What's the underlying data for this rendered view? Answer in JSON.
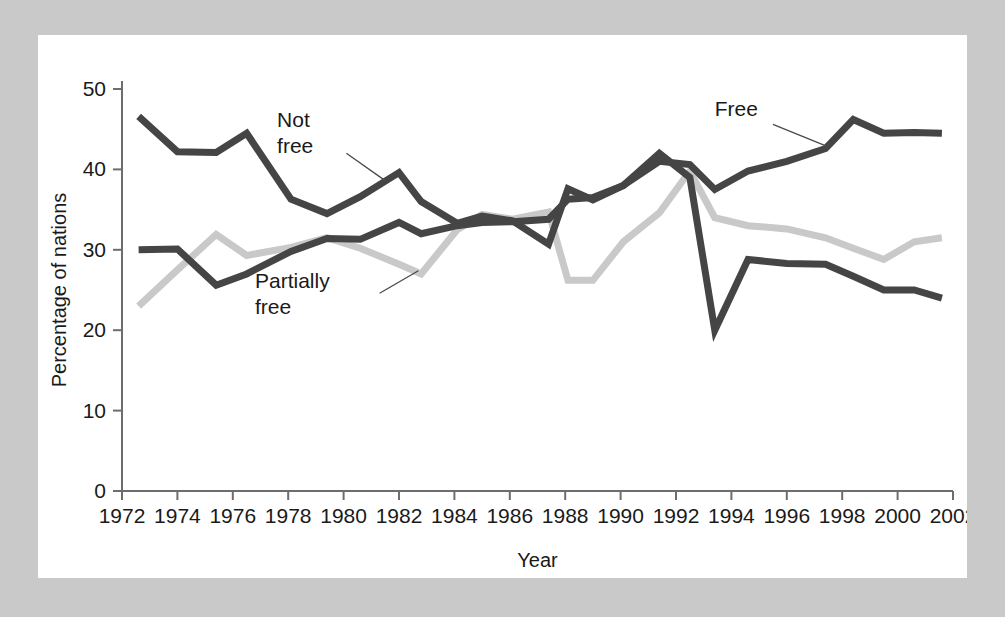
{
  "figure": {
    "panel_background": "#ffffff",
    "frame_background": "#c9c9c9"
  },
  "chart_data": {
    "type": "line",
    "title": "",
    "xlabel": "Year",
    "ylabel": "Percentage of nations",
    "xlim": [
      1972,
      2002
    ],
    "ylim": [
      0,
      50
    ],
    "grid": false,
    "legend_position": "inline-annotations",
    "x_ticks": [
      1972,
      1974,
      1976,
      1978,
      1980,
      1982,
      1984,
      1986,
      1988,
      1990,
      1992,
      1994,
      1996,
      1998,
      2000,
      2002
    ],
    "x_tick_labels": [
      "1972",
      "1974",
      "1976",
      "1978",
      "1980",
      "1982",
      "1984",
      "1986",
      "1988",
      "1990",
      "1992",
      "1994",
      "1996",
      "1998",
      "2000",
      "2002"
    ],
    "y_ticks": [
      0,
      10,
      20,
      30,
      40,
      50
    ],
    "y_tick_labels": [
      "0",
      "10",
      "20",
      "30",
      "40",
      "50"
    ],
    "series": [
      {
        "name": "Not free",
        "color": "#454545",
        "label": "Not free",
        "label_lines": [
          "Not",
          "free"
        ],
        "x": [
          1972.6,
          1974.0,
          1975.4,
          1976.5,
          1978.1,
          1979.4,
          1980.6,
          1982.0,
          1982.8,
          1984.1,
          1985.0,
          1986.1,
          1987.4,
          1988.1,
          1989.0,
          1990.1,
          1991.4,
          1992.5,
          1993.4,
          1994.6,
          1996.0,
          1997.4,
          1998.4,
          1999.5,
          2000.6,
          2001.6
        ],
        "y": [
          46.6,
          42.2,
          42.1,
          44.5,
          36.3,
          34.5,
          36.6,
          39.6,
          36.0,
          33.3,
          34.2,
          33.6,
          30.7,
          37.6,
          36.2,
          38.0,
          42.0,
          39.0,
          20.0,
          28.8,
          28.3,
          28.2,
          26.7,
          25.0,
          25.0,
          24.0
        ]
      },
      {
        "name": "Free",
        "color": "#454545",
        "label": "Free",
        "label_lines": [
          "Free"
        ],
        "x": [
          1972.6,
          1974.0,
          1975.4,
          1976.5,
          1978.1,
          1979.4,
          1980.6,
          1982.0,
          1982.8,
          1984.1,
          1985.0,
          1986.1,
          1987.4,
          1988.1,
          1989.0,
          1990.1,
          1991.4,
          1992.5,
          1993.4,
          1994.6,
          1996.0,
          1997.4,
          1998.4,
          1999.5,
          2000.6,
          2001.6
        ],
        "y": [
          30.0,
          30.1,
          25.6,
          27.0,
          29.8,
          31.4,
          31.3,
          33.4,
          32.0,
          33.0,
          33.4,
          33.5,
          33.8,
          36.3,
          36.5,
          38.0,
          41.0,
          40.6,
          37.5,
          39.8,
          41.0,
          42.6,
          46.2,
          44.5,
          44.6,
          44.5
        ]
      },
      {
        "name": "Partially free",
        "color": "#c9c9c9",
        "label": "Partially free",
        "label_lines": [
          "Partially",
          "free"
        ],
        "x": [
          1972.6,
          1974.0,
          1975.4,
          1976.5,
          1978.1,
          1979.4,
          1980.6,
          1982.0,
          1982.8,
          1984.1,
          1985.0,
          1986.1,
          1987.4,
          1988.1,
          1989.0,
          1990.1,
          1991.4,
          1992.5,
          1993.4,
          1994.6,
          1996.0,
          1997.4,
          1998.4,
          1999.5,
          2000.6,
          2001.6
        ],
        "y": [
          23.0,
          27.5,
          31.9,
          29.3,
          30.3,
          31.5,
          30.2,
          28.2,
          27.0,
          32.5,
          34.4,
          33.8,
          34.7,
          26.2,
          26.2,
          31.0,
          34.6,
          39.8,
          34.0,
          33.0,
          32.6,
          31.5,
          30.2,
          28.8,
          31.0,
          31.5
        ]
      }
    ],
    "annotations": [
      {
        "name": "not-free",
        "text_lines": [
          "Not",
          "free"
        ],
        "text_x": 1977.6,
        "text_y": 45.3,
        "leader_from_x": 1980.1,
        "leader_from_y": 42.0,
        "leader_to_x": 1981.5,
        "leader_to_y": 38.6
      },
      {
        "name": "partially-free",
        "text_lines": [
          "Partially",
          "free"
        ],
        "text_x": 1976.8,
        "text_y": 25.2,
        "leader_from_x": 1981.3,
        "leader_from_y": 24.6,
        "leader_to_x": 1982.7,
        "leader_to_y": 27.4
      },
      {
        "name": "free",
        "text_lines": [
          "Free"
        ],
        "text_x": 1993.4,
        "text_y": 46.6,
        "leader_from_x": 1995.5,
        "leader_from_y": 45.6,
        "leader_to_x": 1997.5,
        "leader_to_y": 42.8
      }
    ]
  }
}
